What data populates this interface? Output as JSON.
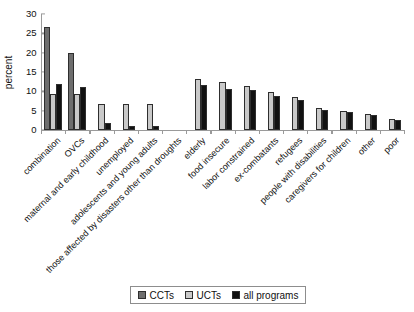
{
  "chart_data": {
    "type": "bar",
    "title": "",
    "xlabel": "",
    "ylabel": "percent",
    "ylim": [
      0,
      30
    ],
    "yticks": [
      0,
      5,
      10,
      15,
      20,
      25,
      30
    ],
    "ytick_labels": [
      "0",
      "5",
      "10",
      "15",
      "20",
      "25",
      "30"
    ],
    "grid": false,
    "legend_position": "bottom-center",
    "categories": [
      "combination",
      "OVCs",
      "maternal and early childhood",
      "unemployed",
      "adolescents and young adults",
      "those affected by disasters other than droughts",
      "elderly",
      "food insecure",
      "labor constrained",
      "ex-combatants",
      "refugees",
      "people with disabilities",
      "caregivers for children",
      "other",
      "poor"
    ],
    "series": [
      {
        "name": "CCTs",
        "color": "#6e6e6e",
        "values": [
          26.7,
          20.0,
          0,
          0,
          0,
          0,
          0,
          0,
          0,
          0,
          0,
          0,
          0,
          0,
          0
        ]
      },
      {
        "name": "UCTs",
        "color": "#c9c9c9",
        "values": [
          9.3,
          9.3,
          6.7,
          6.7,
          6.7,
          0,
          13.3,
          12.4,
          11.3,
          9.9,
          8.5,
          5.6,
          5.0,
          4.2,
          2.8
        ]
      },
      {
        "name": "all programs",
        "color": "#111111",
        "values": [
          11.8,
          11.0,
          1.9,
          1.0,
          1.0,
          0,
          11.7,
          10.6,
          10.3,
          8.9,
          7.8,
          5.3,
          4.6,
          3.9,
          2.6
        ]
      }
    ]
  },
  "axis": {
    "y_title": "percent"
  },
  "legend": {
    "items": [
      {
        "label": "CCTs",
        "color": "#6e6e6e"
      },
      {
        "label": "UCTs",
        "color": "#c9c9c9"
      },
      {
        "label": "all programs",
        "color": "#111111"
      }
    ]
  }
}
